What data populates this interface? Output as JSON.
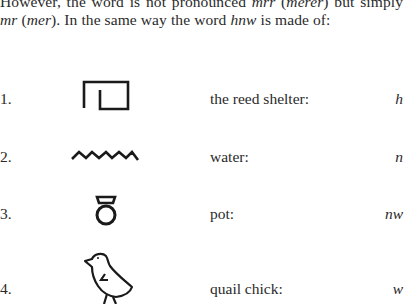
{
  "paragraph": {
    "seg1": "However, the word is not pronounced ",
    "seg2": "mrr",
    "seg3": " (",
    "seg4": "merer",
    "seg5": ") but simply ",
    "seg6": "mr",
    "seg7": " (",
    "seg8": "mer",
    "seg9": "). In the same way the word ",
    "seg10": "hnw",
    "seg11": " is made of:"
  },
  "items": [
    {
      "number": "1.",
      "glyph": "reed-shelter-icon",
      "label": "the reed shelter:",
      "translit": "h"
    },
    {
      "number": "2.",
      "glyph": "water-icon",
      "label": "water:",
      "translit": "n"
    },
    {
      "number": "3.",
      "glyph": "pot-icon",
      "label": "pot:",
      "translit": "nw"
    },
    {
      "number": "4.",
      "glyph": "quail-chick-icon",
      "label": "quail chick:",
      "translit": "w"
    }
  ]
}
